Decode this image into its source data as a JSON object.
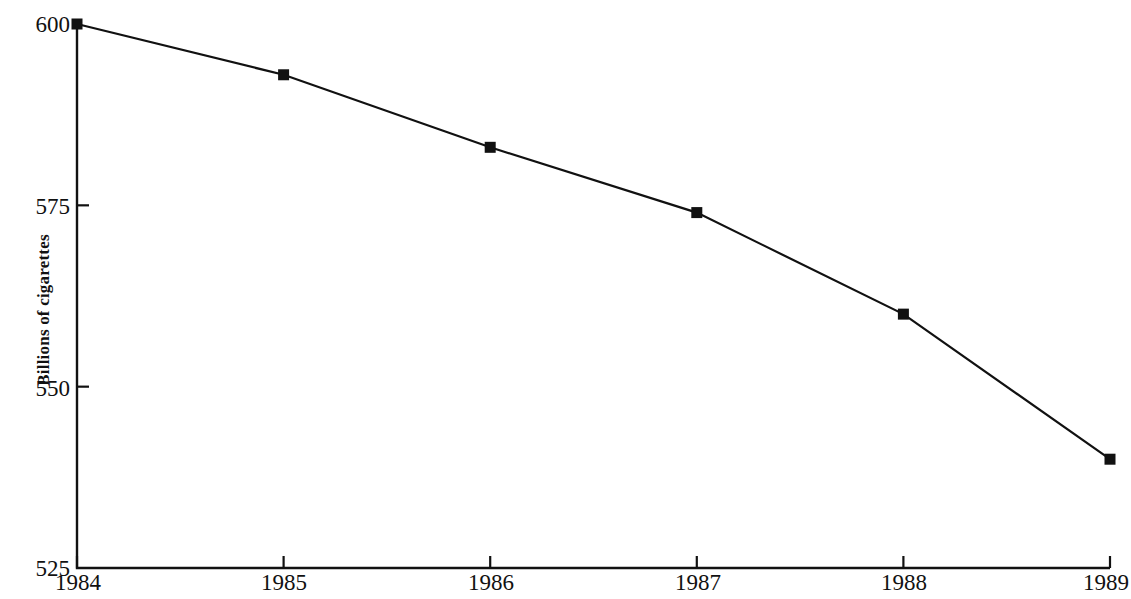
{
  "chart_data": {
    "type": "line",
    "title": "",
    "xlabel": "",
    "ylabel": "Billions of cigarettes",
    "categories": [
      "1984",
      "1985",
      "1986",
      "1987",
      "1988",
      "1989"
    ],
    "x": [
      1984,
      1985,
      1986,
      1987,
      1988,
      1989
    ],
    "values": [
      600,
      593,
      583,
      574,
      560,
      540
    ],
    "series": [
      {
        "name": "Billions of cigarettes",
        "values": [
          600,
          593,
          583,
          574,
          560,
          540
        ]
      }
    ],
    "ylim": [
      525,
      600
    ],
    "xlim": [
      1984,
      1989
    ],
    "ytick_labels": [
      "600",
      "575",
      "550",
      "525"
    ],
    "ytick_values": [
      600,
      575,
      550,
      525
    ],
    "xtick_labels": [
      "1984",
      "1985",
      "1986",
      "1987",
      "1988",
      "1989"
    ],
    "grid": false,
    "legend": "none",
    "marker": "square",
    "line_color": "#111111",
    "marker_color": "#111111"
  },
  "axes": {
    "y_axis_label": "Billions of cigarettes",
    "y_ticks": [
      {
        "label": "600",
        "value": 600
      },
      {
        "label": "575",
        "value": 575
      },
      {
        "label": "550",
        "value": 550
      },
      {
        "label": "525",
        "value": 525
      }
    ],
    "x_ticks": [
      {
        "label": "1984",
        "value": 1984
      },
      {
        "label": "1985",
        "value": 1985
      },
      {
        "label": "1986",
        "value": 1986
      },
      {
        "label": "1987",
        "value": 1987
      },
      {
        "label": "1988",
        "value": 1988
      },
      {
        "label": "1989",
        "value": 1989
      }
    ]
  },
  "artifacts": {
    "top_bleed_text": ""
  }
}
